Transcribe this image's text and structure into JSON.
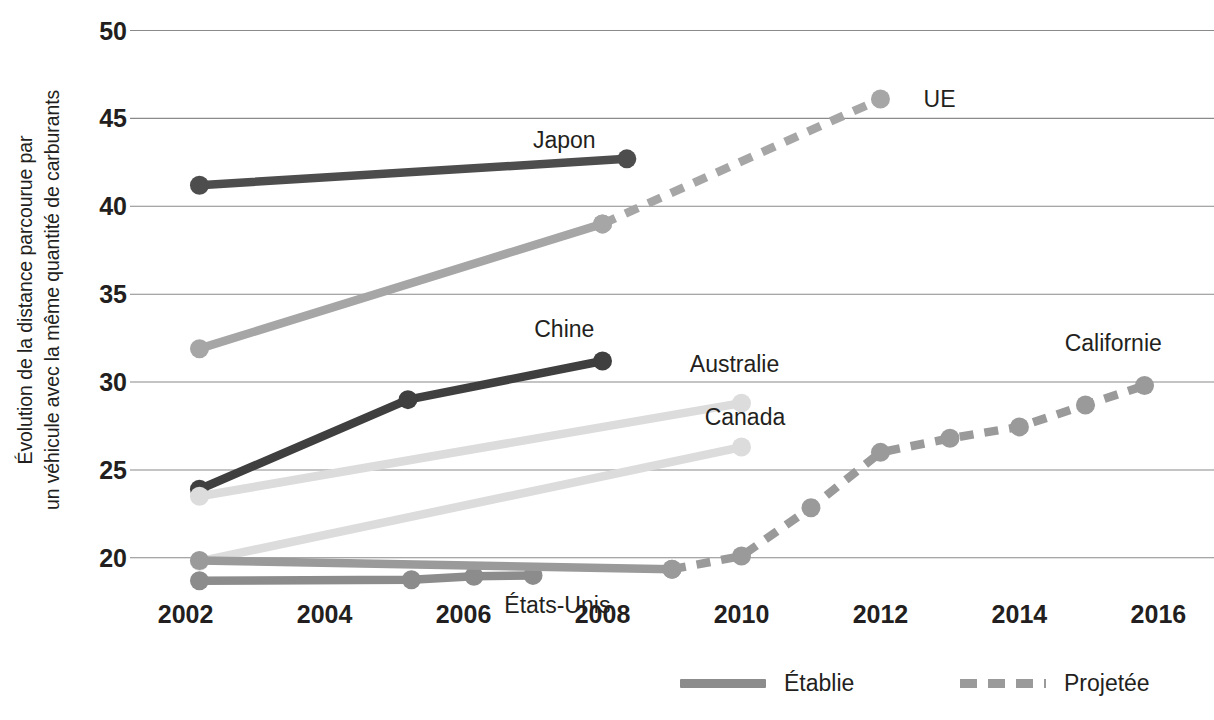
{
  "chart_data": {
    "type": "line",
    "title": "",
    "xlabel": "",
    "ylabel": "Évolution de la distance parcourue par\nun véhicule avec la même quantité de carburants",
    "xlim": [
      2001.2,
      2016.8
    ],
    "ylim": [
      17.6,
      50.6
    ],
    "xticks": [
      "2002",
      "2004",
      "2006",
      "2008",
      "2010",
      "2012",
      "2014",
      "2016"
    ],
    "xtick_values": [
      2002,
      2004,
      2006,
      2008,
      2010,
      2012,
      2014,
      2016
    ],
    "yticks": [
      "20",
      "25",
      "30",
      "35",
      "40",
      "45",
      "50"
    ],
    "ytick_values": [
      20,
      25,
      30,
      35,
      40,
      45,
      50
    ],
    "grid": "horizontal",
    "legend_position": "bottom",
    "legend": [
      {
        "name": "Établie",
        "style": "solid",
        "color": "#8c8c8c"
      },
      {
        "name": "Projetée",
        "style": "dashed",
        "color": "#9a9a9a"
      }
    ],
    "series": [
      {
        "name": "Japon",
        "color": "#4d4d4d",
        "label_x": 2007.45,
        "label_y": 43.8,
        "established": [
          {
            "x": 2002.2,
            "y": 41.2
          },
          {
            "x": 2008.35,
            "y": 42.7
          }
        ],
        "projected": []
      },
      {
        "name": "UE",
        "color": "#a6a6a6",
        "label_x": 2012.85,
        "label_y": 46.1,
        "established": [
          {
            "x": 2002.2,
            "y": 31.9
          },
          {
            "x": 2008.0,
            "y": 39.0
          }
        ],
        "projected": [
          {
            "x": 2008.0,
            "y": 39.0
          },
          {
            "x": 2012.0,
            "y": 46.1
          }
        ]
      },
      {
        "name": "Chine",
        "color": "#3f3f3f",
        "label_x": 2007.45,
        "label_y": 33.0,
        "established": [
          {
            "x": 2002.2,
            "y": 23.9
          },
          {
            "x": 2005.2,
            "y": 29.0
          },
          {
            "x": 2008.0,
            "y": 31.2
          }
        ],
        "projected": []
      },
      {
        "name": "Australie",
        "color": "#dcdcdc",
        "label_x": 2009.9,
        "label_y": 31.0,
        "established": [
          {
            "x": 2002.2,
            "y": 23.5
          },
          {
            "x": 2010.0,
            "y": 28.8
          }
        ],
        "projected": []
      },
      {
        "name": "Canada",
        "color": "#dcdcdc",
        "label_x": 2010.05,
        "label_y": 28.0,
        "established": [
          {
            "x": 2002.2,
            "y": 19.8
          },
          {
            "x": 2010.0,
            "y": 26.3
          }
        ],
        "projected": []
      },
      {
        "name": "États-Unis",
        "color": "#8c8c8c",
        "label_x": 2007.35,
        "label_y": 17.3,
        "established": [
          {
            "x": 2002.2,
            "y": 18.7
          },
          {
            "x": 2005.25,
            "y": 18.75
          },
          {
            "x": 2006.15,
            "y": 18.95
          },
          {
            "x": 2007.0,
            "y": 19.0
          }
        ],
        "projected": []
      },
      {
        "name": "Californie",
        "color": "#9a9a9a",
        "label_x": 2015.35,
        "label_y": 32.2,
        "established": [
          {
            "x": 2002.2,
            "y": 19.85
          },
          {
            "x": 2009.0,
            "y": 19.35
          }
        ],
        "projected": [
          {
            "x": 2009.0,
            "y": 19.35
          },
          {
            "x": 2010.0,
            "y": 20.1
          },
          {
            "x": 2011.0,
            "y": 22.85
          },
          {
            "x": 2012.0,
            "y": 26.0
          },
          {
            "x": 2013.0,
            "y": 26.8
          },
          {
            "x": 2014.0,
            "y": 27.45
          },
          {
            "x": 2014.95,
            "y": 28.7
          },
          {
            "x": 2015.8,
            "y": 29.8
          }
        ]
      }
    ]
  }
}
